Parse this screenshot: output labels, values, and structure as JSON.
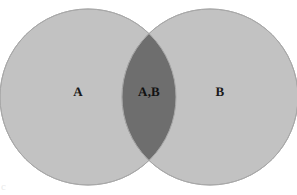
{
  "figure": {
    "type": "venn-diagram",
    "background_color": "#ffffff",
    "width": 297,
    "height": 195
  },
  "sets": [
    {
      "id": "A",
      "label": "A",
      "fill_color": "#c2c2c2",
      "stroke_color": "#a8a8a8",
      "center_x": 88,
      "center_y": 97,
      "radius": 88,
      "label_x": 78,
      "label_y": 92
    },
    {
      "id": "B",
      "label": "B",
      "fill_color": "#c2c2c2",
      "stroke_color": "#a8a8a8",
      "center_x": 210,
      "center_y": 97,
      "radius": 88,
      "label_x": 220,
      "label_y": 92
    }
  ],
  "intersection": {
    "id": "AB",
    "label": "A,B",
    "fill_color": "#6e6e6e",
    "label_x": 149,
    "label_y": 92
  },
  "artifact": {
    "text": "c"
  }
}
